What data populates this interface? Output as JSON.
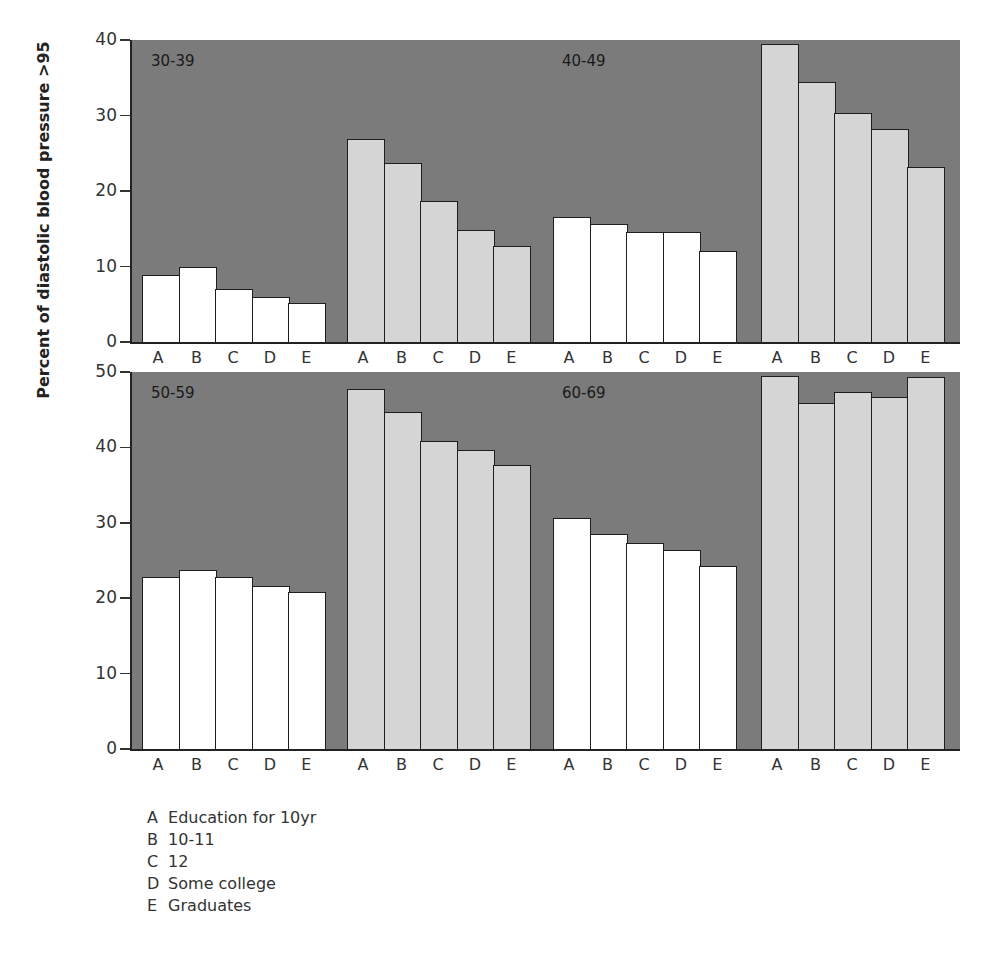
{
  "chart_data": {
    "type": "bar",
    "ylabel": "Percent of diastolic blood pressure >95",
    "xlabel": "",
    "categories": [
      "A",
      "B",
      "C",
      "D",
      "E"
    ],
    "legend": [
      {
        "key": "A",
        "label": "Education for 10yr"
      },
      {
        "key": "B",
        "label": "10-11"
      },
      {
        "key": "C",
        "label": "12"
      },
      {
        "key": "D",
        "label": "Some college"
      },
      {
        "key": "E",
        "label": "Graduates"
      }
    ],
    "panels": [
      {
        "name": "top",
        "ylim": [
          0,
          40
        ],
        "yticks": [
          0,
          10,
          20,
          30,
          40
        ],
        "groups": [
          {
            "age_label": "30-39",
            "bar_color": "white",
            "values": [
              8.9,
              9.9,
              7.0,
              6.0,
              5.2
            ]
          },
          {
            "age_label": "",
            "bar_color": "gray",
            "values": [
              26.9,
              23.7,
              18.7,
              14.8,
              12.7
            ]
          },
          {
            "age_label": "40-49",
            "bar_color": "white",
            "values": [
              16.6,
              15.6,
              14.6,
              14.6,
              12.1
            ]
          },
          {
            "age_label": "",
            "bar_color": "gray",
            "values": [
              39.5,
              34.4,
              30.3,
              28.2,
              23.2
            ]
          }
        ]
      },
      {
        "name": "bottom",
        "ylim": [
          0,
          50
        ],
        "yticks": [
          0,
          10,
          20,
          30,
          40,
          50
        ],
        "groups": [
          {
            "age_label": "50-59",
            "bar_color": "white",
            "values": [
              22.8,
              23.7,
              22.8,
              21.6,
              20.8
            ]
          },
          {
            "age_label": "",
            "bar_color": "gray",
            "values": [
              47.7,
              44.7,
              40.8,
              39.7,
              37.7
            ]
          },
          {
            "age_label": "60-69",
            "bar_color": "white",
            "values": [
              30.6,
              28.5,
              27.3,
              26.4,
              24.3
            ]
          },
          {
            "age_label": "",
            "bar_color": "gray",
            "values": [
              49.5,
              45.9,
              47.3,
              46.7,
              49.4
            ]
          }
        ]
      }
    ],
    "grid": false,
    "legend_position": "bottom-left",
    "colors": {
      "panel_background": "#7b7b7b",
      "bar_white": "#ffffff",
      "bar_gray": "#d5d5d5",
      "outline": "#1e1e1e"
    }
  },
  "legend_lines": {
    "A": {
      "key": "A",
      "label": "Education for 10yr"
    },
    "B": {
      "key": "B",
      "label": "10-11"
    },
    "C": {
      "key": "C",
      "label": "12"
    },
    "D": {
      "key": "D",
      "label": "Some college"
    },
    "E": {
      "key": "E",
      "label": "Graduates"
    }
  }
}
